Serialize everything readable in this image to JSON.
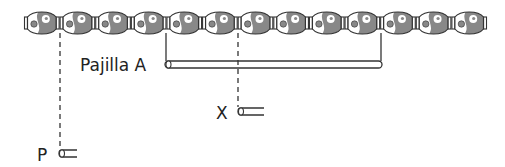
{
  "diagram": {
    "bead_count": 13,
    "colors": {
      "outline": "#333333",
      "bead_fill": "#ffffff",
      "bead_shade": "#888888",
      "line": "#333333"
    },
    "straw_a": {
      "label": "Pajilla A",
      "spans_beads_from": 5,
      "spans_beads_to": 10
    },
    "straw_x": {
      "label": "X",
      "aligned_bead_boundary": 7
    },
    "straw_p": {
      "label": "P",
      "aligned_bead_boundary": 1
    }
  }
}
